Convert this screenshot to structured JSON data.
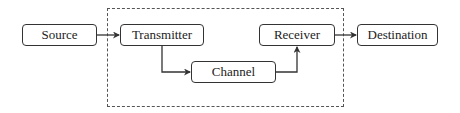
{
  "diagram": {
    "type": "block-flow",
    "title": "",
    "system_boundary": {
      "style": "dashed",
      "contains": [
        "transmitter",
        "channel",
        "receiver"
      ]
    },
    "nodes": {
      "source": {
        "label": "Source"
      },
      "transmitter": {
        "label": "Transmitter"
      },
      "channel": {
        "label": "Channel"
      },
      "receiver": {
        "label": "Receiver"
      },
      "destination": {
        "label": "Destination"
      }
    },
    "edges": [
      {
        "from": "source",
        "to": "transmitter"
      },
      {
        "from": "transmitter",
        "to": "channel"
      },
      {
        "from": "channel",
        "to": "receiver"
      },
      {
        "from": "receiver",
        "to": "destination"
      }
    ],
    "colors": {
      "stroke": "#333333",
      "text": "#222222",
      "background": "#ffffff"
    }
  }
}
